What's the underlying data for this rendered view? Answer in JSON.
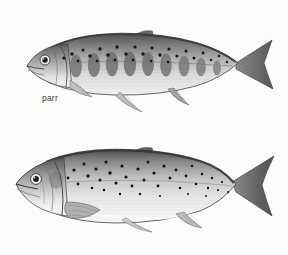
{
  "figure": {
    "background_color": "#fdfdfc",
    "width": 288,
    "height": 255,
    "style": "stipple-and-hatch engraving, monochrome grayscale"
  },
  "palette": {
    "ink": "#2e2e2e",
    "body_dark": "#6d6d6d",
    "body_mid": "#9a9a9a",
    "body_light": "#cfcfcf",
    "belly": "#f2f2f0",
    "spot": "#1d1d1d",
    "fin": "#808080",
    "label_text": "#3a3a3a"
  },
  "specimens": [
    {
      "id": "parr",
      "label": "parr",
      "label_position": {
        "x": 42,
        "y": 94
      },
      "orientation": "left-facing lateral view",
      "panel": {
        "x": 0,
        "y": 0,
        "width": 288,
        "height": 128
      },
      "body_extent": {
        "x": 24,
        "y": 30,
        "width": 250,
        "height": 72
      },
      "markings": {
        "parr_marks": 9,
        "parr_mark_shape": "vertical oval bars along the lateral midline",
        "dorsal_spots": 26,
        "spot_shape": "small round dark spots above the lateral line"
      },
      "fins": [
        "dorsal",
        "adipose",
        "caudal",
        "anal",
        "pelvic",
        "pectoral"
      ],
      "caudal_shape": "deeply forked",
      "coloration": "dark olive back, silvery flanks, pale belly, distinct parr marks"
    },
    {
      "id": "smolt",
      "label": "smolt",
      "label_position": {
        "x": 22,
        "y": 221
      },
      "orientation": "left-facing lateral view",
      "panel": {
        "x": 0,
        "y": 128,
        "width": 288,
        "height": 127
      },
      "body_extent": {
        "x": 14,
        "y": 155,
        "width": 260,
        "height": 78
      },
      "markings": {
        "parr_marks": 0,
        "parr_mark_shape": "none — parr marks lost at smoltification",
        "dorsal_spots": 38,
        "spot_shape": "scattered small round dark spots over the upper flank"
      },
      "fins": [
        "dorsal",
        "adipose",
        "caudal",
        "anal",
        "pelvic",
        "pectoral"
      ],
      "caudal_shape": "forked with dark margin",
      "coloration": "silvery flanks and belly, darker blue-grey back, scattered black spots"
    }
  ]
}
